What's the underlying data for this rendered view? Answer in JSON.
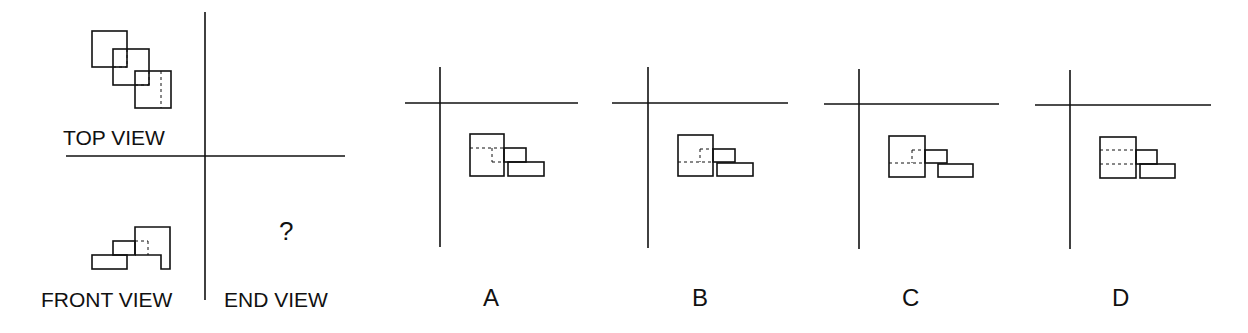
{
  "problem": {
    "labels": {
      "top_view": "TOP VIEW",
      "front_view": "FRONT VIEW",
      "end_view": "END VIEW",
      "unknown": "?"
    }
  },
  "options": [
    {
      "label": "A"
    },
    {
      "label": "B"
    },
    {
      "label": "C"
    },
    {
      "label": "D"
    }
  ],
  "colors": {
    "line": "#111111",
    "background": "#ffffff"
  }
}
